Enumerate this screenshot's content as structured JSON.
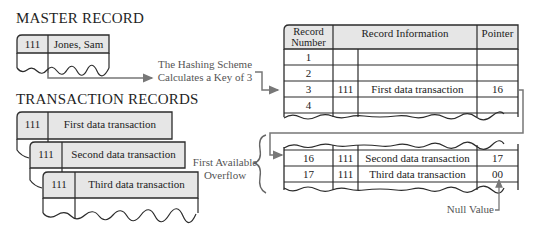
{
  "master": {
    "heading": "MASTER RECORD",
    "key": "111",
    "name": "Jones, Sam"
  },
  "transactions": {
    "heading": "TRANSACTION RECORDS",
    "records": [
      {
        "key": "111",
        "text": "First data transaction"
      },
      {
        "key": "111",
        "text": "Second data transaction"
      },
      {
        "key": "111",
        "text": "Third data transaction"
      }
    ]
  },
  "hashing_label": {
    "line1": "The Hashing Scheme",
    "line2": "Calculates a Key of 3"
  },
  "overflow_label": {
    "line1": "First Available",
    "line2": "Overflow"
  },
  "null_label": "Null Value",
  "main_table": {
    "headers": [
      "Record Number",
      "Record Information",
      "Pointer"
    ],
    "header_number_line1": "Record",
    "header_number_line2": "Number",
    "rows": [
      {
        "num": "1",
        "key": "",
        "info": "",
        "ptr": ""
      },
      {
        "num": "2",
        "key": "",
        "info": "",
        "ptr": ""
      },
      {
        "num": "3",
        "key": "111",
        "info": "First data transaction",
        "ptr": "16"
      },
      {
        "num": "4",
        "key": "",
        "info": "",
        "ptr": ""
      }
    ]
  },
  "overflow_table": {
    "rows": [
      {
        "num": "16",
        "key": "111",
        "info": "Second data transaction",
        "ptr": "17"
      },
      {
        "num": "17",
        "key": "111",
        "info": "Third data transaction",
        "ptr": "00"
      }
    ]
  },
  "colors": {
    "fill": "#e6e6e6",
    "line": "#2b2b2b",
    "arrow": "#777777"
  }
}
